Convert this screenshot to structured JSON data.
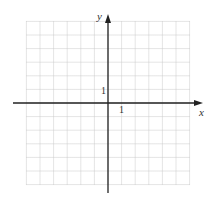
{
  "diagram": {
    "type": "coordinate-grid",
    "x_axis_label": "x",
    "y_axis_label": "y",
    "x_tick_label": "1",
    "y_tick_label": "1",
    "grid_range": {
      "xmin": -6,
      "xmax": 6,
      "ymin": -6,
      "ymax": 6
    },
    "colors": {
      "grid": "#c8c8c8",
      "axis": "#222222",
      "label": "#333333"
    }
  }
}
